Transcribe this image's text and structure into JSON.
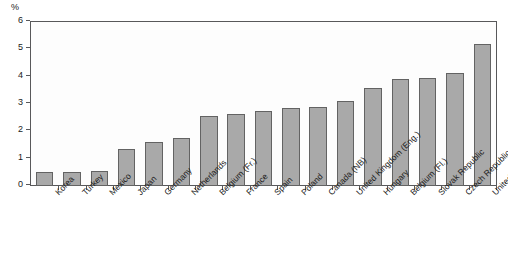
{
  "chart_data": {
    "type": "bar",
    "title": "",
    "subtitle": "",
    "xlabel": "",
    "ylabel": "%",
    "unit_label": "%",
    "ylim": [
      0,
      6
    ],
    "yticks": [
      0,
      1,
      2,
      3,
      4,
      5,
      6
    ],
    "ytick_labels": [
      "0",
      "1",
      "2",
      "3",
      "4",
      "5",
      "6"
    ],
    "grid": false,
    "legend": false,
    "legend_position": "none",
    "bar_fill_color": "#a9a9a9",
    "bar_border_color": "#636363",
    "axis_color": "#58585a",
    "plot_background": "#fdfdfd",
    "categories": [
      "Korea",
      "Turkey",
      "Mexico",
      "Japan",
      "Germany",
      "Netherlands",
      "Belgium (Fr.)",
      "France",
      "Spain",
      "Poland",
      "Canada (NB)",
      "United Kingdom (Eng.)",
      "Hungary",
      "Belgium (Fl.)",
      "Slovak Republic",
      "Czech Republic",
      "United States"
    ],
    "values": [
      0.5,
      0.5,
      0.55,
      1.35,
      1.6,
      1.75,
      2.55,
      2.65,
      2.75,
      2.85,
      2.9,
      3.1,
      3.6,
      3.9,
      3.95,
      4.15,
      5.2
    ]
  }
}
